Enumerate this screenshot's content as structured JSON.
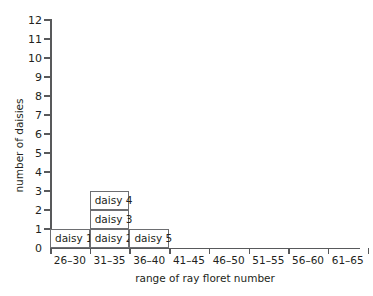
{
  "chart_data": {
    "type": "bar",
    "title": "",
    "subtitle": "",
    "xlabel": "range of ray floret number",
    "ylabel": "number of daisies",
    "categories": [
      "26–30",
      "31–35",
      "36–40",
      "41–45",
      "46–50",
      "51–55",
      "56–60",
      "61–65"
    ],
    "values": [
      1,
      3,
      1,
      0,
      0,
      0,
      0,
      0
    ],
    "ylim": [
      0,
      12
    ],
    "ytick_labels": [
      "0",
      "1",
      "2",
      "3",
      "4",
      "5",
      "6",
      "7",
      "8",
      "9",
      "10",
      "11",
      "12"
    ],
    "ytick_values": [
      0,
      1,
      2,
      3,
      4,
      5,
      6,
      7,
      8,
      9,
      10,
      11,
      12
    ],
    "grid": false,
    "legend": "none",
    "stacked_labels": [
      {
        "category": "26–30",
        "cell_labels": [
          "daisy 1"
        ]
      },
      {
        "category": "31–35",
        "cell_labels": [
          "daisy 2",
          "daisy 3",
          "daisy 4"
        ]
      },
      {
        "category": "36–40",
        "cell_labels": [
          "daisy 5"
        ]
      },
      {
        "category": "41–45",
        "cell_labels": []
      },
      {
        "category": "46–50",
        "cell_labels": []
      },
      {
        "category": "51–55",
        "cell_labels": []
      },
      {
        "category": "56–60",
        "cell_labels": []
      },
      {
        "category": "61–65",
        "cell_labels": []
      }
    ],
    "colors": {
      "bar_fill": "#ffffff",
      "bar_border": "#6d6e71",
      "axis": "#58595b",
      "text": "#231f20",
      "background": "#ffffff"
    }
  }
}
